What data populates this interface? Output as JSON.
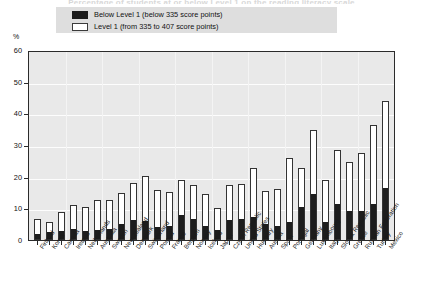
{
  "chart_title": "Percentage of students at or below Level 1 on the reading literacy scale",
  "axis": {
    "y_unit": "%",
    "y_ticks": [
      "60",
      "50",
      "40",
      "30",
      "20",
      "10",
      "0"
    ]
  },
  "legend": {
    "items": [
      {
        "swatch": "black-filled-square",
        "label": "Below Level 1  (below 335 score points)"
      },
      {
        "swatch": "white-outlined-square",
        "label": "Level 1  (from 335 to 407 score points)"
      }
    ]
  },
  "chart_data": {
    "type": "bar",
    "stacked": true,
    "title": "Percentage of students at or below Level 1 on the reading literacy scale",
    "xlabel": "",
    "ylabel": "%",
    "ylim": [
      0,
      60
    ],
    "yticks": [
      0,
      10,
      20,
      30,
      40,
      50,
      60
    ],
    "grid": true,
    "legend_position": "top",
    "categories": [
      "Finland",
      "Korea",
      "Canada",
      "Ireland",
      "Netherlands",
      "Australia",
      "Sweden",
      "New Zealand",
      "Denmark",
      "Switzerland",
      "Poland",
      "France",
      "Belgium",
      "Norway",
      "Iceland",
      "Japan",
      "Czech Republic",
      "United States",
      "Hungary",
      "Austria",
      "Spain",
      "Portugal",
      "Germany",
      "Luxembourg",
      "Italy",
      "Slovak Republic",
      "Greece",
      "Russian Federation",
      "Turkey",
      "Mexico"
    ],
    "series": [
      {
        "name": "Below Level 1  (below 335 score points)",
        "color": "#1d1d1d",
        "values": [
          1.7,
          2.2,
          2.4,
          3.1,
          2.4,
          3.0,
          3.3,
          4.8,
          5.9,
          5.6,
          3.7,
          4.2,
          7.7,
          6.3,
          4.1,
          2.7,
          6.1,
          6.4,
          7.0,
          4.7,
          4.1,
          5.5,
          10.0,
          14.2,
          5.5,
          11.0,
          8.7,
          9.0,
          11.0,
          16.1
        ]
      },
      {
        "name": "Level 1  (from 335 to 407 score points)",
        "color": "#ffffff",
        "values": [
          5.0,
          3.6,
          6.4,
          7.9,
          7.9,
          9.5,
          9.3,
          9.9,
          12.0,
          14.5,
          12.1,
          11.0,
          11.3,
          11.2,
          10.4,
          7.3,
          11.4,
          11.4,
          15.7,
          10.7,
          12.1,
          20.4,
          12.7,
          20.4,
          13.5,
          17.5,
          15.8,
          18.5,
          25.2,
          27.9
        ]
      }
    ],
    "totals": [
      6.7,
      5.8,
      8.8,
      11.0,
      10.3,
      12.5,
      12.6,
      14.7,
      17.9,
      20.1,
      15.8,
      15.2,
      19.0,
      17.5,
      14.5,
      10.0,
      17.5,
      17.8,
      22.7,
      15.4,
      16.2,
      25.9,
      22.7,
      34.6,
      19.0,
      28.5,
      24.5,
      27.5,
      36.2,
      44.0
    ]
  },
  "bars": [
    {
      "country": "Finland",
      "below": 1.7,
      "level1": 5.0
    },
    {
      "country": "Korea",
      "below": 2.2,
      "level1": 3.6
    },
    {
      "country": "Canada",
      "below": 2.4,
      "level1": 6.4
    },
    {
      "country": "Ireland",
      "below": 3.1,
      "level1": 7.9
    },
    {
      "country": "Netherlands",
      "below": 2.4,
      "level1": 7.9
    },
    {
      "country": "Australia",
      "below": 3.0,
      "level1": 9.5
    },
    {
      "country": "Sweden",
      "below": 3.3,
      "level1": 9.3
    },
    {
      "country": "New Zealand",
      "below": 4.8,
      "level1": 9.9
    },
    {
      "country": "Denmark",
      "below": 5.9,
      "level1": 12.0
    },
    {
      "country": "Switzerland",
      "below": 5.6,
      "level1": 14.5
    },
    {
      "country": "Poland",
      "below": 3.7,
      "level1": 12.1
    },
    {
      "country": "France",
      "below": 4.2,
      "level1": 11.0
    },
    {
      "country": "Belgium",
      "below": 7.7,
      "level1": 11.3
    },
    {
      "country": "Norway",
      "below": 6.3,
      "level1": 11.2
    },
    {
      "country": "Iceland",
      "below": 4.1,
      "level1": 10.4
    },
    {
      "country": "Japan",
      "below": 2.7,
      "level1": 7.3
    },
    {
      "country": "Czech Republic",
      "below": 6.1,
      "level1": 11.4
    },
    {
      "country": "United States",
      "below": 6.4,
      "level1": 11.4
    },
    {
      "country": "Hungary",
      "below": 7.0,
      "level1": 15.7
    },
    {
      "country": "Austria",
      "below": 4.7,
      "level1": 10.7
    },
    {
      "country": "Spain",
      "below": 4.1,
      "level1": 12.1
    },
    {
      "country": "Portugal",
      "below": 5.5,
      "level1": 20.4
    },
    {
      "country": "Germany",
      "below": 10.0,
      "level1": 12.7
    },
    {
      "country": "Luxembourg",
      "below": 14.2,
      "level1": 20.4
    },
    {
      "country": "Italy",
      "below": 5.5,
      "level1": 13.5
    },
    {
      "country": "Slovak Republic",
      "below": 11.0,
      "level1": 17.5
    },
    {
      "country": "Greece",
      "below": 8.7,
      "level1": 15.8
    },
    {
      "country": "Russian Federation",
      "below": 9.0,
      "level1": 18.5
    },
    {
      "country": "Turkey",
      "below": 11.0,
      "level1": 25.2
    },
    {
      "country": "Mexico",
      "below": 16.1,
      "level1": 27.9
    }
  ]
}
